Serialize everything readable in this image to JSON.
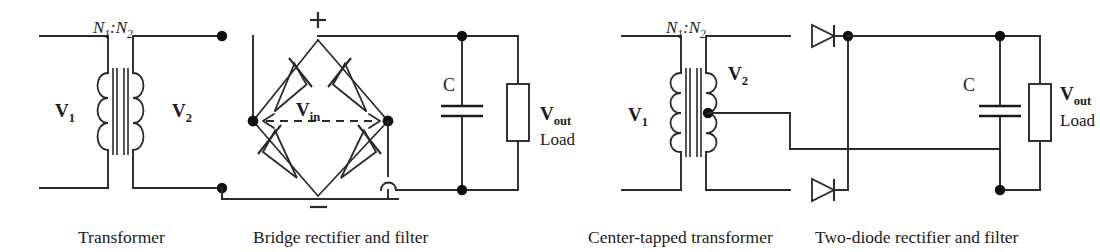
{
  "figure": {
    "background_color": "#ffffff",
    "ink_color": "#2a2a2a"
  },
  "left_circuit": {
    "name": "bridge-rectifier-circuit",
    "turns_ratio": {
      "base1": "N",
      "sub1": "1",
      "sep": ":",
      "base2": "N",
      "sub2": "2"
    },
    "primary_label": {
      "base": "V",
      "sub": "1"
    },
    "secondary_label": {
      "base": "V",
      "sub": "2"
    },
    "bridge_input_label": {
      "base": "V",
      "sub": "in"
    },
    "bridge_plus": "+",
    "bridge_minus": "−",
    "capacitor_label": "C",
    "output_label": {
      "base": "V",
      "sub": "out"
    },
    "load_label": "Load",
    "captions": {
      "transformer": "Transformer",
      "rectifier": "Bridge rectifier and filter"
    },
    "diode_count": 4
  },
  "right_circuit": {
    "name": "two-diode-rectifier-circuit",
    "turns_ratio": {
      "base1": "N",
      "sub1": "1",
      "sep": ":",
      "base2": "N",
      "sub2": "2"
    },
    "primary_label": {
      "base": "V",
      "sub": "1"
    },
    "secondary_label": {
      "base": "V",
      "sub": "2"
    },
    "capacitor_label": "C",
    "output_label": {
      "base": "V",
      "sub": "out"
    },
    "load_label": "Load",
    "captions": {
      "transformer": "Center-tapped transformer",
      "rectifier": "Two-diode rectifier and filter"
    },
    "diode_count": 2
  }
}
